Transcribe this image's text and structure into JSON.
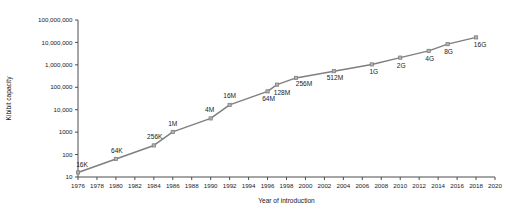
{
  "chart_data": {
    "type": "line",
    "title": "",
    "subtitle": "",
    "xlabel": "Year of introduction",
    "ylabel": "Kibibit capacity",
    "xlim": [
      1976,
      2020
    ],
    "ylim": [
      10,
      100000000
    ],
    "yscale": "log",
    "xscale": "linear",
    "grid": false,
    "legend": "none",
    "x_ticks": [
      1976,
      1978,
      1980,
      1982,
      1984,
      1986,
      1988,
      1990,
      1992,
      1994,
      1996,
      1998,
      2000,
      2002,
      2004,
      2006,
      2008,
      2010,
      2012,
      2014,
      2016,
      2018,
      2020
    ],
    "y_ticks": [
      10,
      100,
      1000,
      10000,
      100000,
      1000000,
      10000000,
      100000000
    ],
    "y_tick_labels": [
      "10",
      "100",
      "1000",
      "10,000",
      "100,000",
      "1,000,000",
      "10,000,000",
      "100,000,000"
    ],
    "series": [
      {
        "name": "DRAM capacity",
        "color": "#7f7f7f",
        "marker": "square",
        "points": [
          {
            "x": 1976,
            "y": 16,
            "label": "16K",
            "label_dx": 4,
            "label_dy": -5
          },
          {
            "x": 1980,
            "y": 64,
            "label": "64K",
            "label_dx": 1,
            "label_dy": -6
          },
          {
            "x": 1984,
            "y": 256,
            "label": "256K",
            "label_dx": 1,
            "label_dy": -6
          },
          {
            "x": 1986,
            "y": 1024,
            "label": "1M",
            "label_dx": 0,
            "label_dy": -6
          },
          {
            "x": 1990,
            "y": 4096,
            "label": "4M",
            "label_dx": -1,
            "label_dy": -6
          },
          {
            "x": 1992,
            "y": 16384,
            "label": "16M",
            "label_dx": 0,
            "label_dy": -7
          },
          {
            "x": 1996,
            "y": 65536,
            "label": "64M",
            "label_dx": 1,
            "label_dy": 10
          },
          {
            "x": 1997,
            "y": 131072,
            "label": "128M",
            "label_dx": 5,
            "label_dy": 10
          },
          {
            "x": 1999,
            "y": 262144,
            "label": "256M",
            "label_dx": 8,
            "label_dy": 8
          },
          {
            "x": 2003,
            "y": 524288,
            "label": "512M",
            "label_dx": 1,
            "label_dy": 9
          },
          {
            "x": 2007,
            "y": 1048576,
            "label": "1G",
            "label_dx": 2,
            "label_dy": 10
          },
          {
            "x": 2010,
            "y": 2097152,
            "label": "2G",
            "label_dx": 1,
            "label_dy": 10
          },
          {
            "x": 2013,
            "y": 4194304,
            "label": "4G",
            "label_dx": 1,
            "label_dy": 10
          },
          {
            "x": 2015,
            "y": 8388608,
            "label": "8G",
            "label_dx": 1,
            "label_dy": 10
          },
          {
            "x": 2018,
            "y": 16777216,
            "label": "16G",
            "label_dx": 4,
            "label_dy": 10
          }
        ]
      }
    ]
  }
}
